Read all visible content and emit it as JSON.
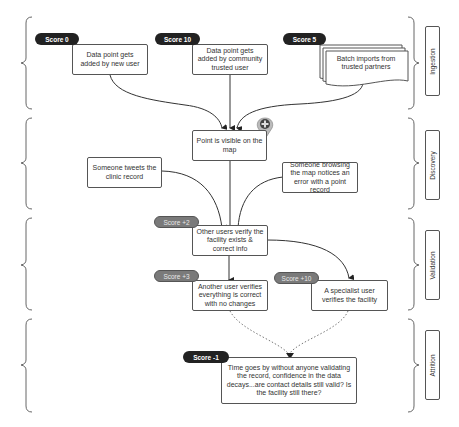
{
  "stages": [
    {
      "id": "ingestion",
      "label": "Ingestion"
    },
    {
      "id": "discovery",
      "label": "Discovery"
    },
    {
      "id": "validation",
      "label": "Validation"
    },
    {
      "id": "attrition",
      "label": "Attrition"
    }
  ],
  "nodes": {
    "new_user": "Data point gets added by new user",
    "community_user": "Data point gets added by community trusted user",
    "batch_imports": "Batch imports from trusted partners",
    "visible_on_map": "Point is visible on the map",
    "tweets": "Someone tweets the clinic record",
    "browsing_error": "Someone browsing the map notices an error with a point record",
    "verify_facility": "Other users verify the facility exists & correct info",
    "another_user": "Another user verifies everything is correct with no changes",
    "specialist": "A specialist user verifies the facility",
    "time_decay": "Time goes by without anyone validating the record, confidence in the data decays...are contact details still valid? Is the facility still there?"
  },
  "scores": {
    "new_user": "Score 0",
    "community_user": "Score 10",
    "batch_imports": "Score 5",
    "verify_facility": "Score +2",
    "another_user": "Score +3",
    "specialist": "Score +10",
    "time_decay": "Score -1"
  },
  "colors": {
    "badge_dark": "#222222",
    "badge_grey": "#7a7a7a",
    "line": "#333333"
  }
}
